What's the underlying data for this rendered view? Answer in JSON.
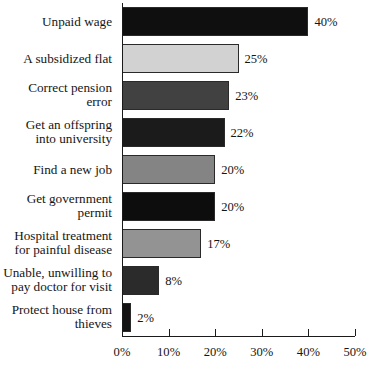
{
  "chart_data": {
    "type": "bar",
    "orientation": "horizontal",
    "title": "",
    "subtitle": "",
    "xlabel": "",
    "ylabel": "",
    "xlim": [
      0,
      50
    ],
    "grid": false,
    "legend": null,
    "value_suffix": "%",
    "axis": {
      "ticks": [
        0,
        10,
        20,
        30,
        40,
        50
      ],
      "tick_labels": [
        "0%",
        "10%",
        "20%",
        "30%",
        "40%",
        "50%"
      ]
    },
    "categories": [
      "Unpaid wage",
      "A subsidized flat",
      "Correct pension\nerror",
      "Get an offspring\ninto university",
      "Find a new job",
      "Get government\npermit",
      "Hospital treatment\nfor painful disease",
      "Unable, unwilling to\npay doctor for visit",
      "Protect house from\nthieves"
    ],
    "values": [
      40,
      25,
      23,
      22,
      20,
      20,
      17,
      8,
      2
    ],
    "data_labels": [
      "40%",
      "25%",
      "23%",
      "22%",
      "20%",
      "20%",
      "17%",
      "8%",
      "2%"
    ],
    "bar_colors": [
      "#0f0f0f",
      "#d2d2d2",
      "#414141",
      "#1b1b1b",
      "#848484",
      "#0d0d0d",
      "#939393",
      "#2b2b2b",
      "#131313"
    ],
    "bar_edge_color": "#2a2a2a",
    "background_color": "#ffffff",
    "text_color": "#151515"
  }
}
